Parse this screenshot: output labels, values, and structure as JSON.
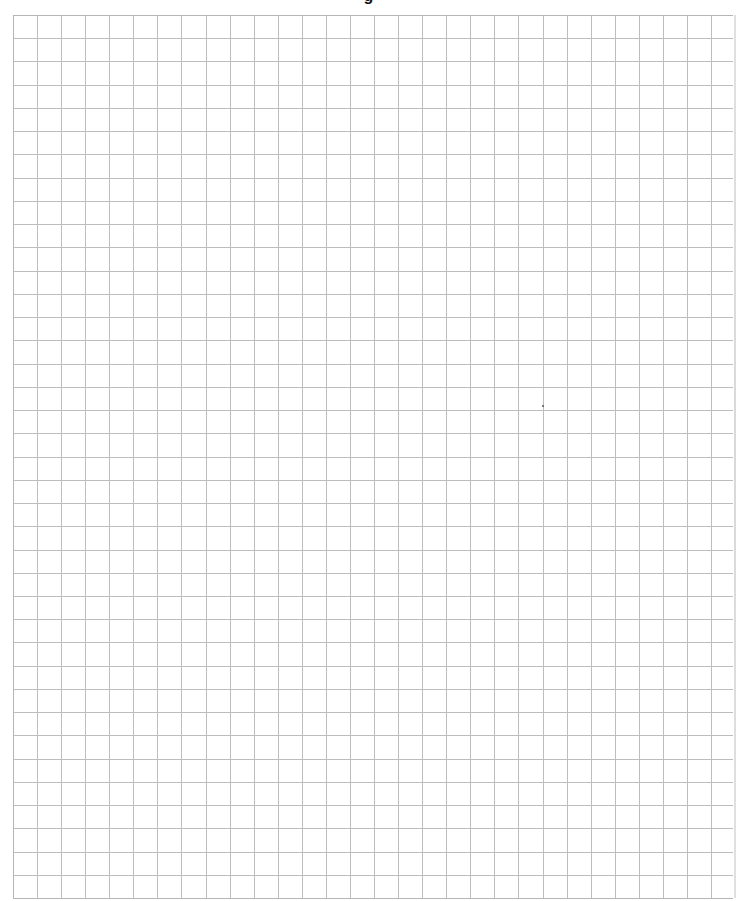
{
  "page": {
    "title_fragment": "g",
    "background_color": "#ffffff"
  },
  "grid": {
    "left": 13,
    "top": 15,
    "right": 733,
    "bottom": 898,
    "columns": 30,
    "rows": 38,
    "cell_width": 24.07,
    "cell_height": 23.24,
    "line_color": "#bdbdbd",
    "border_color": "#b5b5b5",
    "line_width": 1
  },
  "marks": [
    {
      "x": 542,
      "y": 405
    }
  ]
}
